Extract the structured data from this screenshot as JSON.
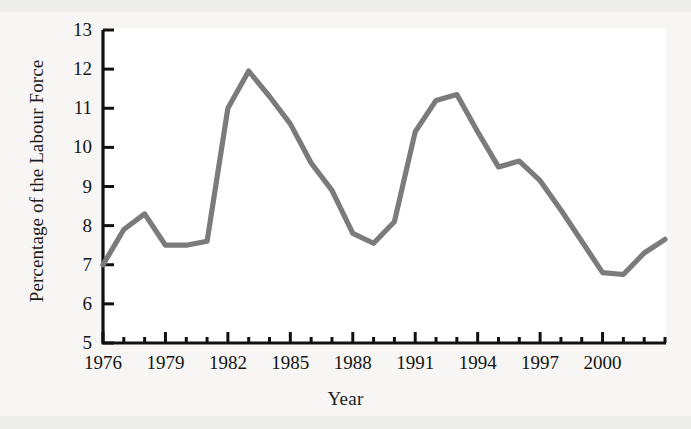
{
  "chart_data": {
    "type": "line",
    "title": "",
    "xlabel": "Year",
    "ylabel": "Percentage of the Labour Force",
    "xlim": [
      1975.3,
      1903.0
    ],
    "ylim": [
      5,
      13
    ],
    "x_tick_labels": [
      "1976",
      "1979",
      "1982",
      "1985",
      "1988",
      "1991",
      "1994",
      "1997",
      "2000"
    ],
    "x_tick_values": [
      1976,
      1979,
      1982,
      1985,
      1988,
      1991,
      1994,
      1997,
      2000
    ],
    "x_minor_tick_interval": 1,
    "y_tick_labels": [
      "5",
      "6",
      "7",
      "8",
      "9",
      "10",
      "11",
      "12",
      "13"
    ],
    "y_tick_values": [
      5,
      6,
      7,
      8,
      9,
      10,
      11,
      12,
      13
    ],
    "grid": false,
    "legend": "none",
    "x": [
      1976,
      1977,
      1978,
      1979,
      1980,
      1981,
      1982,
      1983,
      1984,
      1985,
      1986,
      1987,
      1988,
      1989,
      1990,
      1991,
      1992,
      1993,
      1994,
      1995,
      1996,
      1997,
      1998,
      1999,
      2000,
      2001,
      2002,
      2003
    ],
    "values": [
      7.0,
      7.9,
      8.3,
      7.5,
      7.5,
      7.6,
      11.0,
      11.95,
      11.3,
      10.6,
      9.6,
      8.9,
      7.8,
      7.55,
      8.1,
      10.4,
      11.2,
      11.35,
      10.4,
      9.5,
      9.65,
      9.15,
      8.4,
      7.6,
      6.8,
      6.75,
      7.3,
      7.65
    ]
  },
  "axis": {
    "y_title": "Percentage of the Labour Force",
    "x_title": "Year"
  },
  "style": {
    "line_color": "#7b7b7b",
    "axis_color": "#111111",
    "background": "#f7f6f4",
    "plot_background": "#ffffff",
    "text_color": "#141414"
  }
}
